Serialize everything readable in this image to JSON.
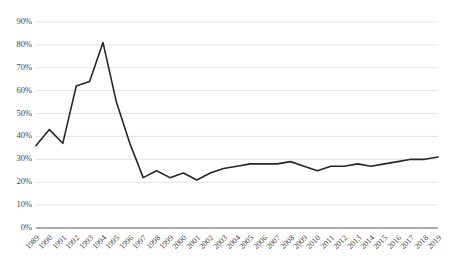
{
  "chart_data": {
    "type": "line",
    "title": "",
    "subtitle": "",
    "xlabel": "",
    "ylabel": "",
    "ylim": [
      0,
      90
    ],
    "ytick_values": [
      0,
      10,
      20,
      30,
      40,
      50,
      60,
      70,
      80,
      90
    ],
    "ytick_labels": [
      "0%",
      "10%",
      "20%",
      "30%",
      "40%",
      "50%",
      "60%",
      "70%",
      "80%",
      "90%"
    ],
    "grid": true,
    "grid_axis": "y",
    "legend": false,
    "legend_position": "none",
    "line_color": "#262626",
    "grid_color": "#d9d9d9",
    "axis_color": "#595959",
    "categories": [
      "1989",
      "1990",
      "1991",
      "1992",
      "1993",
      "1994",
      "1995",
      "1996",
      "1997",
      "1998",
      "1999",
      "2000",
      "2001",
      "2002",
      "2003",
      "2004",
      "2005",
      "2006",
      "2007",
      "2008",
      "2009",
      "2010",
      "2011",
      "2012",
      "2013",
      "2014",
      "2015",
      "2016",
      "2017",
      "2018",
      "2019"
    ],
    "values": [
      36,
      43,
      37,
      62,
      64,
      81,
      55,
      37,
      22,
      25,
      22,
      24,
      21,
      24,
      26,
      27,
      28,
      28,
      28,
      29,
      27,
      25,
      27,
      27,
      28,
      27,
      28,
      29,
      30,
      30,
      31
    ],
    "series": [
      {
        "name": "",
        "values": [
          36,
          43,
          37,
          62,
          64,
          81,
          55,
          37,
          22,
          25,
          22,
          24,
          21,
          24,
          26,
          27,
          28,
          28,
          28,
          29,
          27,
          25,
          27,
          27,
          28,
          27,
          28,
          29,
          30,
          30,
          31
        ]
      }
    ]
  }
}
